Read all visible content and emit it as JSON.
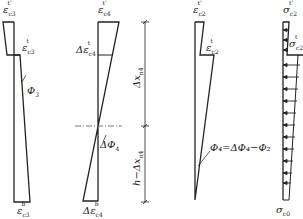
{
  "diagram": {
    "panels": [
      {
        "id": "strain-c3",
        "labels": {
          "top": "εc3t'",
          "mid": "εc3t",
          "curvature": "Φ3",
          "bottom": "εc3b"
        }
      },
      {
        "id": "delta-strain-c4",
        "labels": {
          "top": "εc4t'",
          "mid": "Δεc4t",
          "curvature": "ΔΦ4",
          "bottom": "Δεc4b"
        }
      },
      {
        "id": "dimension",
        "labels": {
          "upper": "Δxn4",
          "lower": "h − Δxn4"
        }
      },
      {
        "id": "strain-c2",
        "labels": {
          "top": "εc2t'",
          "mid": "εc2t",
          "curvature": "Φ4=ΔΦ4−Φ2"
        }
      },
      {
        "id": "stress-c2",
        "labels": {
          "top": "σc2t'",
          "mid": "σc2t",
          "bottom": "σc0"
        }
      }
    ],
    "text": {
      "e": "ε",
      "de": "Δε",
      "s": "σ",
      "c3": "c3",
      "c4": "c4",
      "c2": "c2",
      "c0": "c0",
      "tp": "t'",
      "t": "t",
      "b": "b",
      "phi3": "Φ",
      "phi3sub": "3",
      "dphi4": "ΔΦ",
      "dphi4sub": "4",
      "phi4eq": "Φ₄=ΔΦ₄−Φ₂",
      "dx_upper": "Δx",
      "dx_sub": "n4",
      "dx_lower": "h−Δx"
    },
    "colors": {
      "stroke": "#222222",
      "dash": "#555555",
      "background": "#ffffff"
    }
  }
}
